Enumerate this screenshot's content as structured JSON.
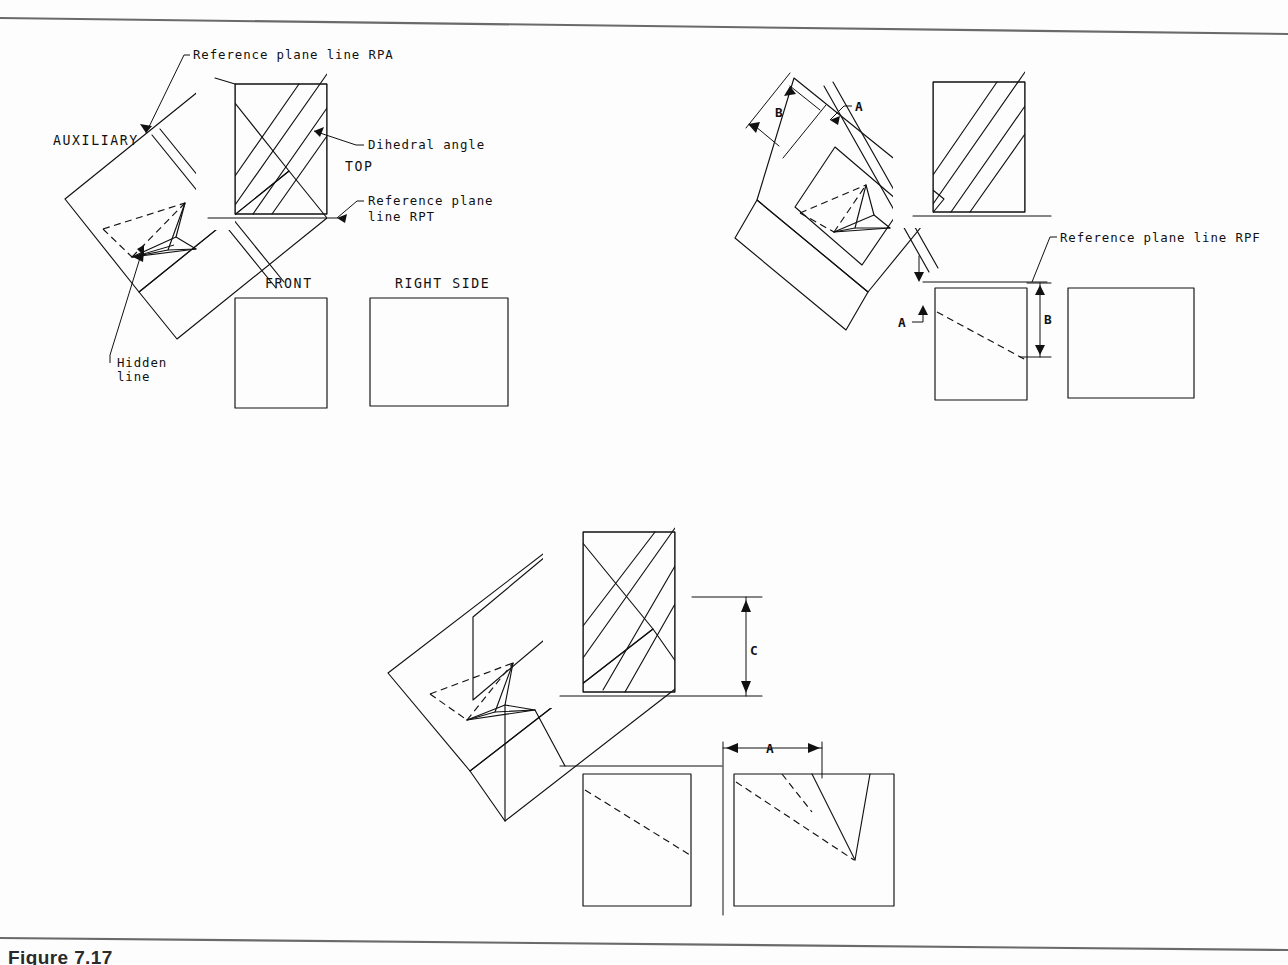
{
  "page": {
    "background_color": "#fdfdfd",
    "ink_color": "#111111",
    "rule_color": "#6a6a6a",
    "caption": "Figure 7.17"
  },
  "figure1": {
    "name": "auxiliary-view-rpa-rpt",
    "labels": {
      "reference_plane_rpa": "Reference plane line RPA",
      "auxiliary": "AUXILIARY",
      "dihedral_angle": "Dihedral angle",
      "top": "TOP",
      "reference_plane_rpt_line1": "Reference plane",
      "reference_plane_rpt_line2": "line RPT",
      "front": "FRONT",
      "right_side": "RIGHT SIDE",
      "hidden_line1": "Hidden",
      "hidden_line2": "line"
    }
  },
  "figure2": {
    "name": "auxiliary-view-rpf-dimensions",
    "labels": {
      "dim_b_aux": "B",
      "dim_a_aux": "A",
      "reference_plane_rpf": "Reference plane line RPF",
      "dim_b_front": "B",
      "dim_a_front": "A"
    }
  },
  "figure3": {
    "name": "auxiliary-view-transfer-dimensions",
    "labels": {
      "dim_c": "C",
      "dim_a": "A"
    }
  }
}
